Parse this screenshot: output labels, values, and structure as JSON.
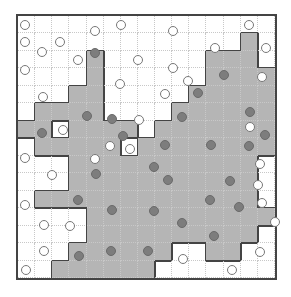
{
  "puzzle": {
    "type": "masyu-like region shading puzzle",
    "rows": 15,
    "cols": 15,
    "colors": {
      "shade": "#b5b5b5",
      "dot": "#7d7d7d",
      "line": "#444444",
      "grid": "#c8c8c8"
    },
    "shaded": [
      [
        0,
        0,
        0,
        0,
        0,
        0,
        0,
        0,
        0,
        0,
        0,
        0,
        0,
        0,
        0
      ],
      [
        0,
        0,
        0,
        0,
        0,
        0,
        0,
        0,
        0,
        0,
        0,
        0,
        0,
        1,
        0
      ],
      [
        0,
        0,
        0,
        0,
        1,
        0,
        0,
        0,
        0,
        0,
        0,
        1,
        1,
        1,
        0
      ],
      [
        0,
        0,
        0,
        0,
        1,
        0,
        0,
        0,
        0,
        0,
        0,
        1,
        1,
        1,
        1
      ],
      [
        0,
        0,
        0,
        1,
        1,
        0,
        0,
        0,
        0,
        0,
        1,
        1,
        1,
        1,
        1
      ],
      [
        0,
        1,
        1,
        1,
        1,
        0,
        0,
        0,
        0,
        1,
        1,
        1,
        1,
        1,
        1
      ],
      [
        1,
        1,
        0,
        1,
        1,
        1,
        1,
        0,
        1,
        1,
        1,
        1,
        1,
        1,
        1
      ],
      [
        0,
        1,
        1,
        1,
        1,
        1,
        0,
        1,
        1,
        1,
        1,
        1,
        1,
        1,
        1
      ],
      [
        0,
        0,
        0,
        1,
        1,
        1,
        1,
        1,
        1,
        1,
        1,
        1,
        1,
        1,
        0
      ],
      [
        0,
        0,
        0,
        1,
        1,
        1,
        1,
        1,
        1,
        1,
        1,
        1,
        1,
        1,
        0
      ],
      [
        0,
        1,
        1,
        1,
        1,
        1,
        1,
        1,
        1,
        1,
        1,
        1,
        1,
        1,
        0
      ],
      [
        0,
        0,
        0,
        0,
        1,
        1,
        1,
        1,
        1,
        1,
        1,
        1,
        1,
        1,
        1
      ],
      [
        0,
        0,
        0,
        0,
        1,
        1,
        1,
        1,
        1,
        1,
        1,
        1,
        1,
        1,
        0
      ],
      [
        0,
        0,
        0,
        1,
        1,
        1,
        1,
        1,
        1,
        0,
        0,
        1,
        1,
        0,
        0
      ],
      [
        0,
        0,
        1,
        1,
        1,
        1,
        1,
        1,
        0,
        0,
        0,
        0,
        0,
        0,
        0
      ]
    ],
    "open_circles": [
      [
        25,
        25
      ],
      [
        121,
        25
      ],
      [
        249,
        25
      ],
      [
        95,
        31
      ],
      [
        173,
        31
      ],
      [
        25,
        42
      ],
      [
        60,
        42
      ],
      [
        215,
        48
      ],
      [
        42,
        52
      ],
      [
        266,
        48
      ],
      [
        78,
        60
      ],
      [
        138,
        60
      ],
      [
        173,
        68
      ],
      [
        25,
        70
      ],
      [
        262,
        77
      ],
      [
        120,
        84
      ],
      [
        188,
        81
      ],
      [
        43,
        97
      ],
      [
        165,
        94
      ],
      [
        63,
        130
      ],
      [
        139,
        120
      ],
      [
        110,
        146
      ],
      [
        250,
        127
      ],
      [
        25,
        158
      ],
      [
        130,
        149
      ],
      [
        95,
        159
      ],
      [
        260,
        164
      ],
      [
        52,
        175
      ],
      [
        258,
        185
      ],
      [
        262,
        203
      ],
      [
        25,
        205
      ],
      [
        44,
        225
      ],
      [
        70,
        226
      ],
      [
        275,
        222
      ],
      [
        44,
        251
      ],
      [
        260,
        252
      ],
      [
        183,
        259
      ],
      [
        26,
        270
      ],
      [
        232,
        270
      ]
    ],
    "filled_dots": [
      [
        95,
        53
      ],
      [
        224,
        75
      ],
      [
        198,
        93
      ],
      [
        87,
        116
      ],
      [
        42,
        133
      ],
      [
        112,
        119
      ],
      [
        182,
        117
      ],
      [
        123,
        136
      ],
      [
        165,
        145
      ],
      [
        211,
        145
      ],
      [
        250,
        112
      ],
      [
        265,
        135
      ],
      [
        249,
        146
      ],
      [
        154,
        167
      ],
      [
        96,
        174
      ],
      [
        168,
        180
      ],
      [
        230,
        181
      ],
      [
        78,
        200
      ],
      [
        210,
        200
      ],
      [
        112,
        210
      ],
      [
        154,
        211
      ],
      [
        239,
        207
      ],
      [
        182,
        223
      ],
      [
        214,
        236
      ],
      [
        79,
        256
      ],
      [
        111,
        251
      ],
      [
        148,
        251
      ]
    ]
  }
}
